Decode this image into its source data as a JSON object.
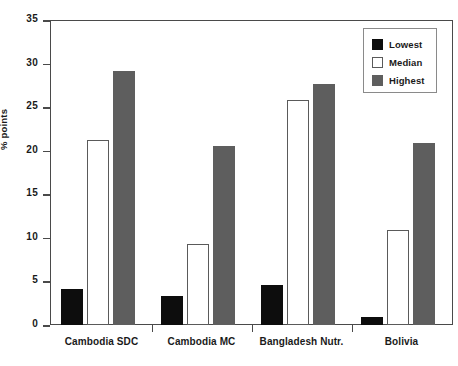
{
  "chart_data": {
    "type": "bar",
    "title": "",
    "xlabel": "",
    "ylabel": "% points",
    "ylim": [
      0,
      35
    ],
    "yticks": [
      0,
      5,
      10,
      15,
      20,
      25,
      30,
      35
    ],
    "grid": false,
    "legend_position": "top-right",
    "categories": [
      "Cambodia SDC",
      "Cambodia MC",
      "Bangladesh Nutr.",
      "Bolivia"
    ],
    "series": [
      {
        "name": "Lowest",
        "color": "#0d0d0d",
        "values": [
          4.2,
          3.3,
          4.6,
          0.9
        ]
      },
      {
        "name": "Median",
        "color": "#ffffff",
        "values": [
          21.3,
          9.3,
          26.0,
          11.0
        ]
      },
      {
        "name": "Highest",
        "color": "#5e5e5e",
        "values": [
          29.3,
          20.7,
          27.8,
          21.0
        ]
      }
    ]
  },
  "axis": {
    "y_label": "% points",
    "y_ticks": [
      "0",
      "5",
      "10",
      "15",
      "20",
      "25",
      "30",
      "35"
    ],
    "x_labels": [
      "Cambodia SDC",
      "Cambodia MC",
      "Bangladesh Nutr.",
      "Bolivia"
    ]
  },
  "legend": {
    "items": [
      {
        "label": "Lowest"
      },
      {
        "label": "Median"
      },
      {
        "label": "Highest"
      }
    ]
  }
}
